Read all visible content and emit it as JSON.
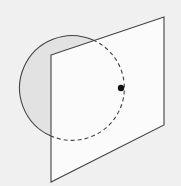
{
  "diagram": {
    "title": "",
    "elements": [
      {
        "id": "circle",
        "kind": "circle",
        "visible_style": "solid",
        "hidden_style": "dashed"
      },
      {
        "id": "plane",
        "kind": "parallelogram"
      },
      {
        "id": "point",
        "kind": "point",
        "label": ""
      }
    ],
    "colors": {
      "background": "#f0f0f0",
      "plane_fill": "#fbfbfb",
      "circle_fill": "#e2e2e2",
      "stroke": "#444444",
      "point": "#111111"
    }
  }
}
